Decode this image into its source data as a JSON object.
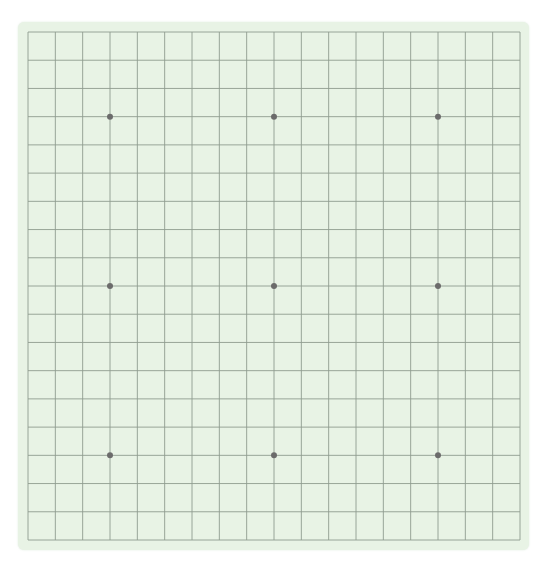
{
  "board": {
    "size": 19,
    "background": "#e8f3e5",
    "line_color": "#8f9c8f",
    "star_color": "#6b6b6b",
    "star_points": [
      [
        3,
        3
      ],
      [
        3,
        9
      ],
      [
        3,
        15
      ],
      [
        9,
        3
      ],
      [
        9,
        9
      ],
      [
        9,
        15
      ],
      [
        15,
        3
      ],
      [
        15,
        9
      ],
      [
        15,
        15
      ]
    ],
    "stones": []
  }
}
